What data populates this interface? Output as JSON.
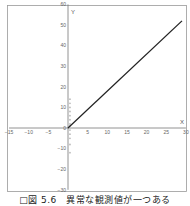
{
  "chart_data": {
    "type": "scatter",
    "title": "",
    "xlabel": "X",
    "ylabel": "Y",
    "xlim": [
      -15,
      30
    ],
    "ylim": [
      -30,
      60
    ],
    "x_ticks": [
      -15,
      -10,
      -5,
      0,
      5,
      10,
      15,
      20,
      25,
      30
    ],
    "y_ticks": [
      60,
      50,
      40,
      30,
      20,
      10,
      0,
      -10,
      -20,
      -30
    ],
    "x_tick_labels": [
      "−15",
      "−10",
      "−5",
      "0",
      "5",
      "10",
      "15",
      "20",
      "25",
      "30"
    ],
    "y_tick_labels": [
      "60",
      "50",
      "40",
      "30",
      "20",
      "10",
      "0",
      "−10",
      "−20",
      "−30"
    ],
    "grid": false,
    "series": [
      {
        "name": "fitted line",
        "kind": "line",
        "x": [
          0,
          29
        ],
        "y": [
          0,
          52
        ],
        "color": "#222222"
      },
      {
        "name": "observations",
        "kind": "points",
        "x": [
          0.5,
          0.5,
          0.5,
          0.5,
          0.5,
          0.5,
          0.5,
          0.5,
          0.5,
          0.5,
          0.5,
          0.5,
          0.5
        ],
        "y": [
          14,
          12,
          10,
          8,
          6,
          4,
          2,
          1,
          -1,
          -3,
          -5,
          -8,
          -12
        ],
        "color": "#bbbbbb"
      }
    ]
  },
  "caption": "□図 5.6　異常な観測値が一つある"
}
